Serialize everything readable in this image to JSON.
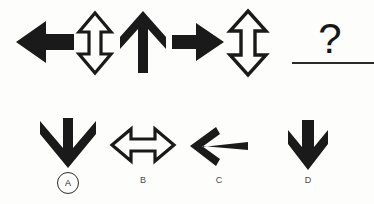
{
  "puzzle": {
    "type": "visual-sequence-reasoning",
    "background_color": "#fdfdfc",
    "ink_color": "#161616",
    "question_symbol": "?",
    "sequence": [
      {
        "position": 1,
        "icon": "arrow-left-solid",
        "direction": "left",
        "style": "solid",
        "heads": 1,
        "x": 16,
        "y": 20,
        "w": 58,
        "h": 44
      },
      {
        "position": 2,
        "icon": "arrow-up-down-outline",
        "direction": "vertical",
        "style": "outline",
        "heads": 2,
        "x": 78,
        "y": 13,
        "w": 34,
        "h": 60
      },
      {
        "position": 3,
        "icon": "arrow-up-solid",
        "direction": "up",
        "style": "solid",
        "heads": 1,
        "x": 120,
        "y": 11,
        "w": 46,
        "h": 62
      },
      {
        "position": 4,
        "icon": "arrow-right-solid",
        "direction": "right",
        "style": "solid",
        "heads": 1,
        "x": 172,
        "y": 22,
        "w": 52,
        "h": 40
      },
      {
        "position": 5,
        "icon": "arrow-up-down-outline",
        "direction": "vertical",
        "style": "outline",
        "heads": 2,
        "x": 229,
        "y": 11,
        "w": 38,
        "h": 64
      },
      {
        "position": 6,
        "icon": "question-mark",
        "direction": "unknown",
        "style": "text",
        "heads": 0,
        "x": 316,
        "y": 18,
        "w": 28,
        "h": 42
      }
    ],
    "answer_blank": {
      "underline_x": 292,
      "underline_y": 62,
      "underline_w": 82,
      "underline_h": 2
    },
    "options": [
      {
        "label": "A",
        "selected": true,
        "icon": "arrow-down-solid-thin-shaft",
        "direction": "down",
        "style": "solid",
        "heads": 1,
        "x": 40,
        "y": 118,
        "w": 56,
        "h": 50,
        "label_x": 57,
        "label_y": 172
      },
      {
        "label": "B",
        "selected": false,
        "icon": "arrow-left-right-outline",
        "direction": "horizontal",
        "style": "outline",
        "heads": 2,
        "x": 112,
        "y": 128,
        "w": 62,
        "h": 34,
        "label_x": 130,
        "label_y": 176
      },
      {
        "label": "C",
        "selected": false,
        "icon": "arrow-left-solid-open-head",
        "direction": "left",
        "style": "solid",
        "heads": 1,
        "x": 190,
        "y": 126,
        "w": 58,
        "h": 40,
        "label_x": 206,
        "label_y": 176
      },
      {
        "label": "D",
        "selected": false,
        "icon": "arrow-down-solid-bold",
        "direction": "down",
        "style": "solid",
        "heads": 1,
        "x": 288,
        "y": 120,
        "w": 40,
        "h": 50,
        "label_x": 295,
        "label_y": 176
      }
    ]
  }
}
